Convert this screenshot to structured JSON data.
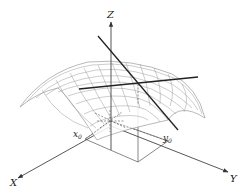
{
  "figure": {
    "type": "3D surface with tangent lines at a point",
    "axes": {
      "x_label": "X",
      "y_label": "Y",
      "z_label": "Z"
    },
    "point_labels": {
      "x0_base": "x",
      "x0_sub": "0",
      "y0_base": "y",
      "y0_sub": "0"
    },
    "elements": [
      "downward-curved saddle-like surface mesh",
      "tangent line along x-direction",
      "tangent line along y-direction",
      "dashed projection lines to point (x0, y0)",
      "ground rectangle projection"
    ],
    "colors": {
      "background": "#ffffff",
      "axis": "#444444",
      "mesh": "#9a9a9a",
      "tangent": "#222222"
    }
  }
}
